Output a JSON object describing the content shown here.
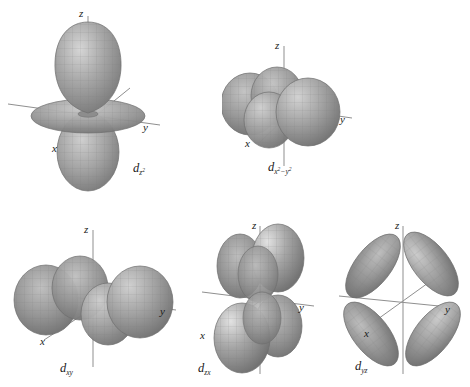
{
  "figure": {
    "background_color": "#ffffff",
    "surface_color": "#9a9a9a",
    "surface_highlight_color": "#e8e8e8",
    "surface_shadow_color": "#6e6e6e",
    "mesh_color": "#7b7b7b",
    "axis_color": "#8c8c8c",
    "text_color": "#1a1a1a",
    "width": 470,
    "height": 387
  },
  "orbitals": [
    {
      "id": "dz2",
      "label_base": "d",
      "label_sub": "z",
      "label_sup": "2",
      "label_plain": "dz2",
      "axes": {
        "x": "x",
        "y": "y",
        "z": "z"
      },
      "lobe_count": 2,
      "has_torus": true,
      "description": "two lobes along z with a doughnut-shaped torus in the xy plane"
    },
    {
      "id": "dx2-y2",
      "label_base": "d",
      "label_sub_x": "x",
      "label_sub_x_sup": "2",
      "label_sub_minus": "−y",
      "label_sub_y_sup": "2",
      "label_plain": "dx2-y2",
      "axes": {
        "x": "x",
        "y": "y",
        "z": "z"
      },
      "lobe_count": 4,
      "has_torus": false,
      "description": "four lobes pointing along the x and y axes"
    },
    {
      "id": "dxy",
      "label_base": "d",
      "label_sub": "xy",
      "label_plain": "dxy",
      "axes": {
        "x": "x",
        "y": "y",
        "z": "z"
      },
      "lobe_count": 4,
      "has_torus": false,
      "description": "four lobes lying between the x and y axes"
    },
    {
      "id": "dzx",
      "label_base": "d",
      "label_sub": "zx",
      "label_plain": "dzx",
      "axes": {
        "x": "x",
        "y": "y",
        "z": "z"
      },
      "lobe_count": 4,
      "has_torus": false,
      "description": "four lobes lying between the z and x axes"
    },
    {
      "id": "dyz",
      "label_base": "d",
      "label_sub": "yz",
      "label_plain": "dyz",
      "axes": {
        "x": "x",
        "y": "y",
        "z": "z"
      },
      "lobe_count": 4,
      "has_torus": false,
      "description": "four lobes lying between the y and z axes"
    }
  ]
}
